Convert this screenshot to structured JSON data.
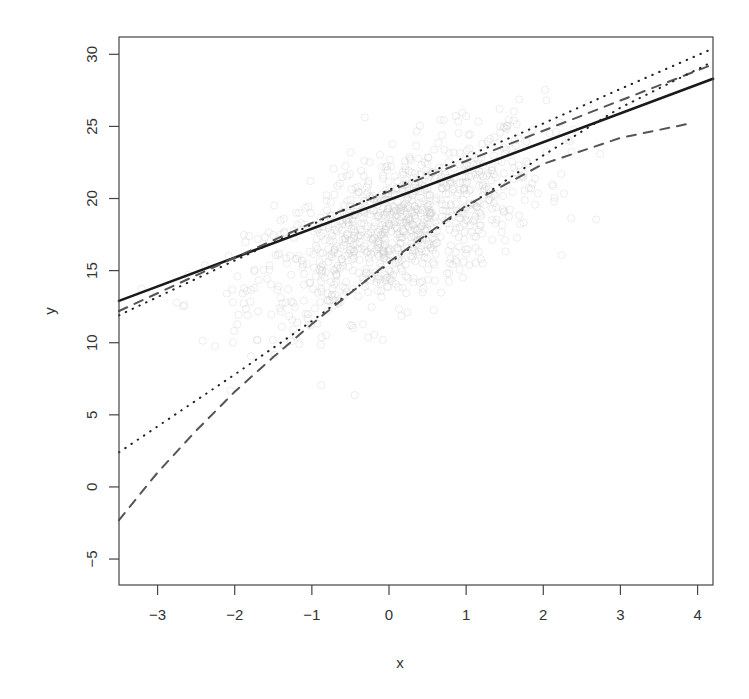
{
  "chart_data": {
    "type": "line",
    "title": "",
    "xlabel": "x",
    "ylabel": "y",
    "xlim": [
      -3.5,
      4.2
    ],
    "ylim": [
      -6.8,
      31.2
    ],
    "xticks": [
      -3,
      -2,
      -1,
      0,
      1,
      2,
      3,
      4
    ],
    "yticks": [
      -5,
      0,
      5,
      10,
      15,
      20,
      25,
      30
    ],
    "xtick_labels": [
      "−3",
      "−2",
      "−1",
      "0",
      "1",
      "2",
      "3",
      "4"
    ],
    "ytick_labels": [
      "−5",
      "0",
      "5",
      "10",
      "15",
      "20",
      "25",
      "30"
    ],
    "grid": false,
    "legend": null,
    "scatter": {
      "description": "light grey open circles, ~1000 points, centered near x=0, y=18, trend slope ~2",
      "color": "#c8c8c8",
      "n": 1000
    },
    "series": [
      {
        "name": "solid fitted line",
        "style": "solid",
        "color": "#1a1a1a",
        "width": 2.6,
        "x": [
          -3.5,
          4.2
        ],
        "y": [
          12.9,
          28.3
        ]
      },
      {
        "name": "upper dashed",
        "style": "dashed",
        "color": "#555555",
        "width": 2.0,
        "x": [
          -3.5,
          -2,
          -1,
          0,
          1,
          2,
          3,
          4.2
        ],
        "y": [
          12.2,
          15.9,
          18.3,
          20.5,
          22.6,
          24.7,
          26.8,
          29.3
        ]
      },
      {
        "name": "upper dotted",
        "style": "dotted",
        "color": "#222222",
        "width": 2.0,
        "x": [
          -3.5,
          -2,
          -1,
          0,
          1,
          2,
          3,
          4.2
        ],
        "y": [
          11.9,
          15.7,
          18.2,
          20.6,
          22.9,
          25.2,
          27.6,
          30.4
        ]
      },
      {
        "name": "lower dotted",
        "style": "dotted",
        "color": "#222222",
        "width": 2.0,
        "x": [
          -3.5,
          -3,
          -2,
          -1,
          0,
          1,
          2,
          3,
          4.2
        ],
        "y": [
          2.4,
          4.2,
          7.8,
          11.5,
          15.5,
          19.4,
          23.0,
          26.3,
          29.5
        ]
      },
      {
        "name": "lower dashed",
        "style": "dashed",
        "color": "#555555",
        "width": 2.0,
        "x": [
          -3.5,
          -3,
          -2.5,
          -2,
          -1.5,
          -1,
          0,
          1,
          2,
          3,
          3.9
        ],
        "y": [
          -2.3,
          1.0,
          3.9,
          6.6,
          9.0,
          11.3,
          15.6,
          19.5,
          22.4,
          24.2,
          25.2
        ]
      }
    ]
  }
}
